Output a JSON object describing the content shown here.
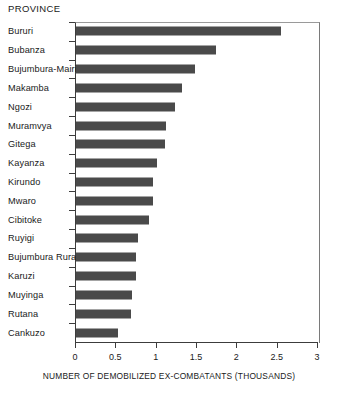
{
  "chart_data": {
    "type": "bar",
    "orientation": "horizontal",
    "title": "",
    "header": "PROVINCE",
    "xlabel": "NUMBER OF DEMOBILIZED EX-COMBATANTS (THOUSANDS)",
    "ylabel": "PROVINCE",
    "xlim": [
      0,
      3
    ],
    "xticks": [
      0,
      0.5,
      1,
      1.5,
      2,
      2.5,
      3
    ],
    "xtick_labels": [
      "0",
      "0.5",
      "1",
      "1.5",
      "2",
      "2.5",
      "3"
    ],
    "grid": false,
    "legend": null,
    "bar_color": "#4a4a4a",
    "categories": [
      "Bururi",
      "Bubanza",
      "Bujumbura-Mairie",
      "Makamba",
      "Ngozi",
      "Muramvya",
      "Gitega",
      "Kayanza",
      "Kirundo",
      "Mwaro",
      "Cibitoke",
      "Ruyigi",
      "Bujumbura Rural",
      "Karuzi",
      "Muyinga",
      "Rutana",
      "Cankuzo"
    ],
    "values": [
      2.54,
      1.73,
      1.48,
      1.31,
      1.23,
      1.11,
      1.1,
      1.0,
      0.95,
      0.95,
      0.9,
      0.77,
      0.74,
      0.74,
      0.69,
      0.68,
      0.52
    ]
  }
}
